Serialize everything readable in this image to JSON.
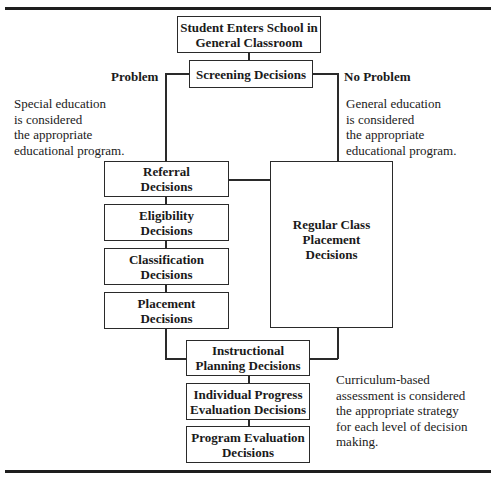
{
  "diagram": {
    "nodes": {
      "start": "Student Enters School in General Classroom",
      "screening": "Screening Decisions",
      "referral": "Referral Decisions",
      "eligibility": "Eligibility Decisions",
      "classification": "Classification Decisions",
      "placement": "Placement Decisions",
      "regular": "Regular Class Placement Decisions",
      "instructional": "Instructional Planning Decisions",
      "progress": "Individual Progress Evaluation Decisions",
      "program": "Program Evaluation Decisions"
    },
    "node_lines": {
      "start": [
        "Student Enters School in",
        "General Classroom"
      ],
      "screening": [
        "Screening Decisions"
      ],
      "referral": [
        "Referral",
        "Decisions"
      ],
      "eligibility": [
        "Eligibility",
        "Decisions"
      ],
      "classification": [
        "Classification",
        "Decisions"
      ],
      "placement": [
        "Placement",
        "Decisions"
      ],
      "regular": [
        "Regular Class",
        "Placement",
        "Decisions"
      ],
      "instructional": [
        "Instructional",
        "Planning Decisions"
      ],
      "progress": [
        "Individual Progress",
        "Evaluation Decisions"
      ],
      "program": [
        "Program Evaluation",
        "Decisions"
      ]
    },
    "branch_labels": {
      "left": "Problem",
      "right": "No Problem"
    },
    "notes": {
      "left": [
        "Special education",
        "is considered",
        "the appropriate",
        "educational program."
      ],
      "right": [
        "General education",
        "is considered",
        "the appropriate",
        "educational program."
      ],
      "bottom": [
        "Curriculum-based",
        "assessment is considered",
        "the appropriate strategy",
        "for each level of decision",
        "making."
      ]
    },
    "edges": [
      [
        "start",
        "screening"
      ],
      [
        "screening",
        "referral"
      ],
      [
        "screening",
        "regular"
      ],
      [
        "referral",
        "regular"
      ],
      [
        "referral",
        "eligibility"
      ],
      [
        "eligibility",
        "classification"
      ],
      [
        "classification",
        "placement"
      ],
      [
        "placement",
        "instructional"
      ],
      [
        "regular",
        "instructional"
      ],
      [
        "instructional",
        "progress"
      ],
      [
        "progress",
        "program"
      ]
    ]
  }
}
